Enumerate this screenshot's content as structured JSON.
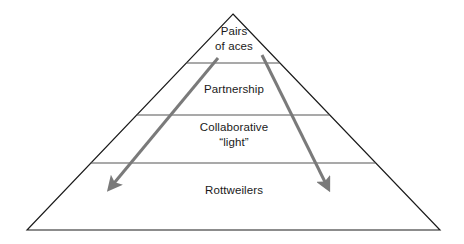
{
  "diagram": {
    "type": "pyramid",
    "colors": {
      "outline": "#1a1a1a",
      "divider": "#555555",
      "arrow": "#7a7a7a",
      "text": "#1a1a1a",
      "background": "#ffffff"
    },
    "tiers": [
      {
        "id": "apex",
        "label": "Pairs\nof aces",
        "level": 1
      },
      {
        "id": "partnership",
        "label": "Partnership",
        "level": 2
      },
      {
        "id": "collaborative",
        "label": "Collaborative\n“light”",
        "level": 3
      },
      {
        "id": "rottweilers",
        "label": "Rottweilers",
        "level": 4
      }
    ],
    "arrows": [
      {
        "id": "arrow-left",
        "direction": "down-left",
        "from": {
          "x": 218,
          "y": 58
        },
        "to": {
          "x": 108,
          "y": 190
        }
      },
      {
        "id": "arrow-right",
        "direction": "down-right",
        "from": {
          "x": 262,
          "y": 55
        },
        "to": {
          "x": 330,
          "y": 190
        }
      }
    ],
    "geometry": {
      "apex": {
        "x": 233,
        "y": 14
      },
      "base_left": {
        "x": 27,
        "y": 230
      },
      "base_right": {
        "x": 440,
        "y": 230
      },
      "dividers_y": [
        63,
        115,
        163
      ]
    }
  }
}
